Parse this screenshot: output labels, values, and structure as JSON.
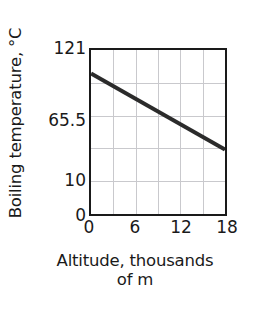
{
  "chart_data": {
    "type": "line",
    "title": "",
    "xlabel": "Altitude, thousands of m",
    "xlabel_line1": "Altitude, thousands",
    "xlabel_line2": "of m",
    "ylabel": "Boiling temperature, °C",
    "x": [
      0,
      18
    ],
    "values": [
      100,
      60
    ],
    "series": [
      {
        "name": "Boiling temperature",
        "x": [
          0,
          18
        ],
        "values": [
          100,
          60
        ]
      }
    ],
    "xlim": [
      0,
      18
    ],
    "ylim": [
      0,
      121
    ],
    "x_ticks": [
      {
        "value": 0,
        "label": "0",
        "pos_pct": 0
      },
      {
        "value": 6,
        "label": "6",
        "pos_pct": 33.333
      },
      {
        "value": 12,
        "label": "12",
        "pos_pct": 66.667
      },
      {
        "value": 18,
        "label": "18",
        "pos_pct": 100
      }
    ],
    "y_ticks": [
      {
        "value": 121,
        "label": "121",
        "top_px": 40
      },
      {
        "value": 65.5,
        "label": "65.5",
        "top_px": 112
      },
      {
        "value": 10,
        "label": "10",
        "top_px": 172
      },
      {
        "value": 0,
        "label": "0",
        "top_px": 207
      }
    ],
    "gridlines_vertical_pct": [
      16.667,
      33.333,
      50,
      66.667,
      83.333
    ],
    "gridlines_horizontal_pct": [
      20,
      40,
      60,
      80
    ],
    "grid": true,
    "legend": "none",
    "line_color": "#2b2b2b",
    "grid_color": "#c9c9cd",
    "axis_color": "#1a1a1a",
    "background_color": "#ffffff",
    "line_start_y_pct": 14.3,
    "line_end_y_pct": 60.7
  }
}
